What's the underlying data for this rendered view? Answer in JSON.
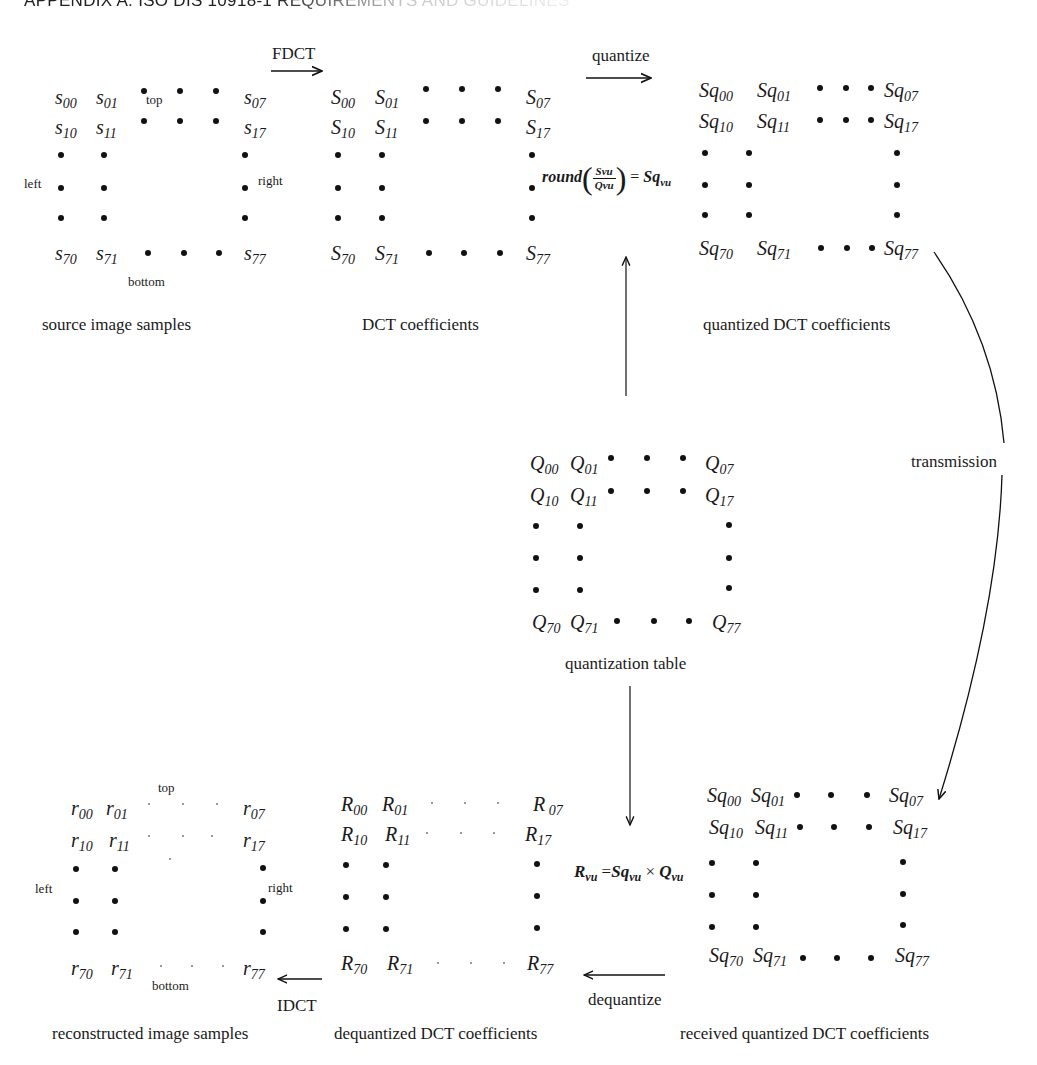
{
  "header": {
    "title": "APPENDIX A. ISO DIS 10918-1 REQUIREMENTS AND GUIDELINES"
  },
  "blocks": {
    "source": {
      "caption": "source image samples",
      "top": "top",
      "bottom": "bottom",
      "left": "left",
      "right": "right",
      "cells": {
        "c00": "s",
        "c01": "s",
        "c07": "s",
        "c10": "s",
        "c11": "s",
        "c17": "s",
        "c70": "s",
        "c71": "s",
        "c77": "s"
      }
    },
    "dct": {
      "caption": "DCT coefficients"
    },
    "quantized": {
      "caption": "quantized DCT coefficients"
    },
    "qtable": {
      "caption": "quantization table"
    },
    "received": {
      "caption": "received quantized DCT coefficients"
    },
    "dequantized": {
      "caption": "dequantized DCT coefficients"
    },
    "reconstructed": {
      "caption": "reconstructed image samples",
      "top": "top",
      "bottom": "bottom",
      "left": "left",
      "right": "right"
    }
  },
  "subscripts": {
    "s00": "00",
    "s01": "01",
    "s07": "07",
    "s10": "10",
    "s11": "11",
    "s17": "17",
    "s70": "70",
    "s71": "71",
    "s77": "77",
    "s07sp": " 07"
  },
  "symbols": {
    "s": "s",
    "S": "S",
    "Sq": "Sq",
    "Q": "Q",
    "R": "R",
    "r": "r"
  },
  "arrows": {
    "fdct": "FDCT",
    "quantize": "quantize",
    "transmission": "transmission",
    "dequantize": "dequantize",
    "idct": "IDCT"
  },
  "formulas": {
    "quantize": {
      "fn": "round",
      "num": "Svu",
      "den": "Qvu",
      "eq": "= Sq",
      "sub": "vu"
    },
    "dequantize": {
      "lhs": "R",
      "lhs_sub": "vu",
      "eq": "=Sq",
      "mid_sub": "vu",
      "times": "×",
      "rhs": "Q",
      "rhs_sub": "vu"
    }
  }
}
